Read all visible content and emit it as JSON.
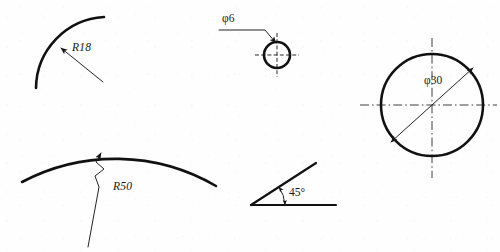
{
  "sheet": {
    "title": "Engineering dimensioning examples",
    "background_color": "#fefefe",
    "line_color": "#111111",
    "width": 500,
    "height": 252
  },
  "figures": [
    {
      "id": "radius-arc-r18",
      "name": "R18 arc with radial leader",
      "label": "R18",
      "value": 18,
      "symbol": "R",
      "dimension_type": "radius",
      "label_x": 72,
      "label_y": 50,
      "arc": {
        "cx": 108,
        "cy": 88,
        "r": 72,
        "start_deg": 180,
        "end_deg": 250
      },
      "leader": {
        "x1": 104,
        "y1": 83,
        "x2": 60,
        "y2": 47
      }
    },
    {
      "id": "diameter-circle-phi6",
      "name": "Small circle with diameter leader",
      "label": "φ6",
      "value": 6,
      "symbol": "φ",
      "dimension_type": "diameter",
      "label_x": 222,
      "label_y": 19,
      "circle": {
        "cx": 277,
        "cy": 55,
        "r": 13
      },
      "leader_points": "219,30 265,30 277,44",
      "centerlines": {
        "horizontal": {
          "x1": 255,
          "y1": 55,
          "x2": 299,
          "y2": 55
        },
        "vertical": {
          "x1": 277,
          "y1": 33,
          "x2": 277,
          "y2": 77
        }
      }
    },
    {
      "id": "radius-arc-r50",
      "name": "R50 arc with jogged (foreshortened) leader",
      "label": "R50",
      "value": 50,
      "symbol": "R",
      "dimension_type": "radius",
      "label_x": 113,
      "label_y": 190,
      "arc": {
        "cx": 120,
        "cy": 348,
        "r": 200,
        "start_deg": 208,
        "end_deg": 332
      },
      "leader_points": "88,247 99,186 95,175 104,168 96,161 101,152",
      "arrow_tip": {
        "x": 103,
        "y": 148
      }
    },
    {
      "id": "angle-45",
      "name": "45 degree angle dimension",
      "label": "45°",
      "value": 45,
      "symbol": "°",
      "dimension_type": "angle",
      "label_x": 289,
      "label_y": 196,
      "base_line": {
        "x1": 251,
        "y1": 205,
        "x2": 336,
        "y2": 205
      },
      "angle_line": {
        "x1": 251,
        "y1": 205,
        "x2": 316,
        "y2": 163
      },
      "arc": {
        "cx": 251,
        "cy": 205,
        "r": 34
      }
    },
    {
      "id": "diameter-circle-phi30",
      "name": "Large circle with diameter dimension",
      "label": "φ30",
      "value": 30,
      "symbol": "φ",
      "dimension_type": "diameter",
      "label_x": 424,
      "label_y": 81,
      "circle": {
        "cx": 432,
        "cy": 105,
        "r": 51
      },
      "dimension_line": {
        "x1": 390,
        "y1": 143,
        "x2": 474,
        "y2": 67
      },
      "centerlines": {
        "horizontal": {
          "x1": 360,
          "y1": 105,
          "x2": 497,
          "y2": 105
        },
        "vertical": {
          "x1": 432,
          "y1": 38,
          "x2": 432,
          "y2": 178
        }
      }
    }
  ]
}
